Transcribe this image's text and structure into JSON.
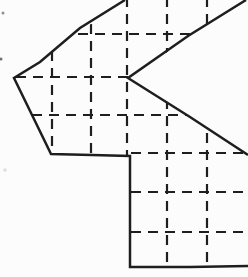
{
  "canvas": {
    "width": 248,
    "height": 277,
    "background": "#fcfcfc"
  },
  "figure": {
    "stroke_color": "#1e1e1e",
    "outline_stroke_width": 2.5,
    "grid_stroke_width": 2.2,
    "grid_dash_array": "10 7",
    "outline_chains": [
      {
        "name": "main-outline",
        "points": [
          [
            125,
            0
          ],
          [
            80,
            28
          ],
          [
            40,
            62
          ],
          [
            14,
            78
          ],
          [
            33,
            117
          ],
          [
            51,
            154
          ],
          [
            92,
            155
          ],
          [
            130,
            156
          ],
          [
            130,
            212
          ],
          [
            130,
            267
          ],
          [
            190,
            267
          ],
          [
            248,
            266
          ]
        ]
      },
      {
        "name": "notch-outline",
        "points": [
          [
            246,
            0
          ],
          [
            188,
            36
          ],
          [
            128,
            78
          ],
          [
            190,
            117
          ],
          [
            248,
            155
          ]
        ]
      }
    ],
    "clip_polygon": [
      [
        14,
        78
      ],
      [
        125,
        0
      ],
      [
        246,
        0
      ],
      [
        128,
        78
      ],
      [
        248,
        155
      ],
      [
        248,
        267
      ],
      [
        130,
        267
      ],
      [
        130,
        156
      ],
      [
        51,
        154
      ]
    ],
    "grid": {
      "vertical_lines": [
        {
          "x": 52,
          "y1": 51,
          "y2": 156
        },
        {
          "x": 91,
          "y1": 24,
          "y2": 156
        },
        {
          "x": 127,
          "y1": -3,
          "y2": 157
        },
        {
          "x": 167,
          "y1": -3,
          "y2": 268
        },
        {
          "x": 207,
          "y1": -3,
          "y2": 268
        }
      ],
      "horizontal_lines": [
        {
          "y": 34,
          "x1": 78,
          "x2": 248
        },
        {
          "y": 77,
          "x1": 16,
          "x2": 248
        },
        {
          "y": 115,
          "x1": 32,
          "x2": 248
        },
        {
          "y": 153,
          "x1": 131,
          "x2": 248
        },
        {
          "y": 192,
          "x1": 131,
          "x2": 248
        },
        {
          "y": 232,
          "x1": 131,
          "x2": 248
        }
      ]
    },
    "paper_specks": [
      {
        "x": 3,
        "y": 13,
        "r": 1.5,
        "color": "#909090"
      },
      {
        "x": 1,
        "y": 59,
        "r": 1.5,
        "color": "#707070"
      },
      {
        "x": 5,
        "y": 170,
        "r": 1.8,
        "color": "#dedede"
      }
    ]
  }
}
